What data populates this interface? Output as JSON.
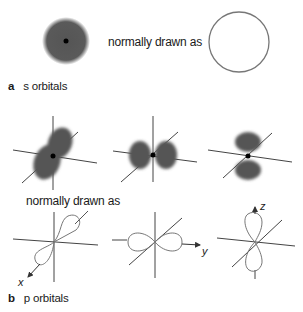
{
  "section_a": {
    "tag": "a",
    "caption": "s orbitals",
    "middle_text": "normally drawn as"
  },
  "section_b": {
    "tag": "b",
    "caption": "p orbitals",
    "middle_text": "normally drawn as",
    "axes": {
      "x": "x",
      "y": "y",
      "z": "z"
    }
  },
  "colors": {
    "lobe": "#555555",
    "outline": "#777777",
    "axis": "#444444",
    "nucleus": "#000000"
  }
}
